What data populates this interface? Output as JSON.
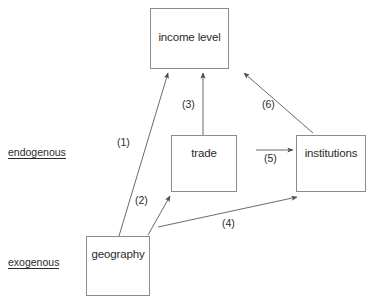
{
  "diagram": {
    "type": "causal-path-diagram",
    "width": 370,
    "height": 301,
    "background_color": "#ffffff",
    "line_color": "#6b6b6b",
    "box_border_color": "#8c8c8c",
    "text_color": "#2b2b2b"
  },
  "axis_labels": {
    "endogenous": "endogenous",
    "exogenous": "exogenous"
  },
  "nodes": [
    {
      "id": "income",
      "label": "income level",
      "x": 150,
      "y": 8,
      "w": 79,
      "h": 61,
      "tier": "endogenous"
    },
    {
      "id": "trade",
      "label": "trade",
      "x": 171,
      "y": 135,
      "w": 66,
      "h": 57,
      "tier": "endogenous"
    },
    {
      "id": "institutions",
      "label": "institutions",
      "x": 296,
      "y": 135,
      "w": 70,
      "h": 57,
      "tier": "endogenous"
    },
    {
      "id": "geography",
      "label": "geography",
      "x": 86,
      "y": 236,
      "w": 64,
      "h": 60,
      "tier": "exogenous"
    }
  ],
  "edges": [
    {
      "id": "e1",
      "label": "(1)",
      "from": "geography",
      "to": "income",
      "x1": 119,
      "y1": 236,
      "x2": 168,
      "y2": 72,
      "label_x": 117,
      "label_y": 136
    },
    {
      "id": "e2",
      "label": "(2)",
      "from": "geography",
      "to": "trade",
      "x1": 148,
      "y1": 235,
      "x2": 170,
      "y2": 195,
      "label_x": 135,
      "label_y": 194
    },
    {
      "id": "e3",
      "label": "(3)",
      "from": "trade",
      "to": "income",
      "x1": 203,
      "y1": 135,
      "x2": 203,
      "y2": 72,
      "label_x": 182,
      "label_y": 98
    },
    {
      "id": "e4",
      "label": "(4)",
      "from": "geography",
      "to": "institutions",
      "x1": 158,
      "y1": 227,
      "x2": 297,
      "y2": 197,
      "label_x": 222,
      "label_y": 217
    },
    {
      "id": "e5",
      "label": "(5)",
      "from": "trade",
      "to": "institutions",
      "x1": 256,
      "y1": 150,
      "x2": 293,
      "y2": 150,
      "label_x": 264,
      "label_y": 152
    },
    {
      "id": "e6",
      "label": "(6)",
      "from": "institutions",
      "to": "income",
      "x1": 313,
      "y1": 133,
      "x2": 244,
      "y2": 72,
      "label_x": 262,
      "label_y": 98
    }
  ]
}
